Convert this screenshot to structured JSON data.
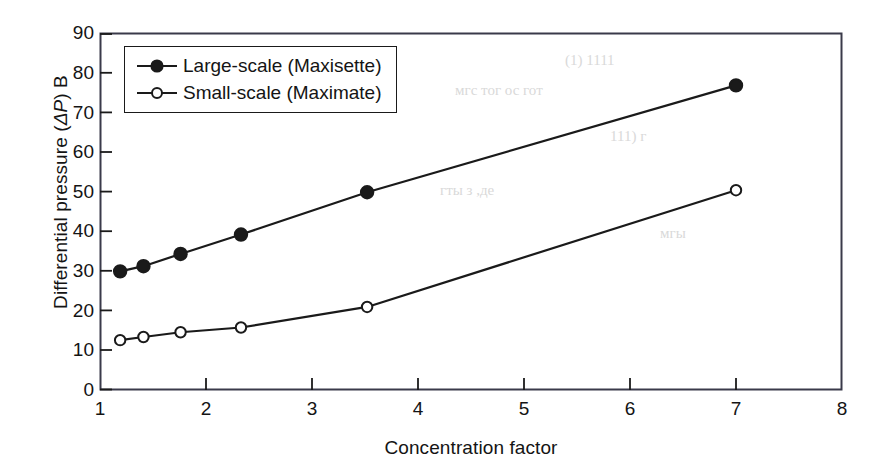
{
  "chart_data": {
    "type": "line",
    "title": "",
    "xlabel": "Concentration factor",
    "ylabel": "Differential pressure (ΔP) B",
    "xlim": [
      1,
      8
    ],
    "ylim": [
      0,
      90
    ],
    "xticks": [
      "1",
      "2",
      "3",
      "4",
      "5",
      "6",
      "7",
      "8"
    ],
    "yticks": [
      "0",
      "10",
      "20",
      "30",
      "40",
      "50",
      "60",
      "70",
      "80",
      "90"
    ],
    "grid": false,
    "legend_position": "upper-left-inside",
    "series": [
      {
        "name": "Large-scale (Maxisette)",
        "marker": "filled-circle",
        "x": [
          1.19,
          1.41,
          1.76,
          2.33,
          3.52,
          7.0
        ],
        "values": [
          30.0,
          31.3,
          34.4,
          39.3,
          50.0,
          77.0
        ]
      },
      {
        "name": "Small-scale (Maximate)",
        "marker": "open-circle",
        "x": [
          1.19,
          1.41,
          1.76,
          2.33,
          3.52,
          7.0
        ],
        "values": [
          12.6,
          13.4,
          14.6,
          15.8,
          21.0,
          50.5
        ]
      }
    ]
  },
  "legend": {
    "items": [
      {
        "label": "Large-scale (Maxisette)"
      },
      {
        "label": "Small-scale (Maximate)"
      }
    ]
  },
  "axes": {
    "x_title": "Concentration factor",
    "y_title_prefix": "Differential pressure (",
    "y_title_symbol": "ΔP",
    "y_title_suffix": ") B"
  },
  "colors": {
    "line": "#1a1a1a",
    "frame": "#3a3a4a",
    "text": "#141414",
    "background": "#ffffff"
  },
  "background_artifacts": {
    "top_right": "(1) 1111",
    "row2": "мгс тог ос гот",
    "row3": "111) г",
    "row4": "гты з ,де",
    "row5": "мгы"
  }
}
